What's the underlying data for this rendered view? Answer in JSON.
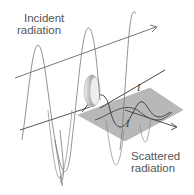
{
  "diagram": {
    "labels": {
      "incident_line1": "Incident",
      "incident_line2": "radiation",
      "scattered_line1": "Scattered",
      "scattered_line2": "radiation",
      "intensity_top": "I",
      "intensity_bottom": "I"
    },
    "elements": {
      "incident_wave": "large sine wave (incident radiation)",
      "incident_axis": "propagation arrow of incident radiation",
      "scatterer": "grey ellipsoidal scattering object",
      "scatter_plane": "grey plane of scattered radiation",
      "scattered_wave": "small sine wave (scattered radiation)",
      "scattered_axis": "propagation arrow of scattered radiation"
    },
    "colors": {
      "line": "#555555",
      "plane": "#b8b8b8",
      "scatterer": "#c8c8c8",
      "text": "#555555"
    }
  }
}
